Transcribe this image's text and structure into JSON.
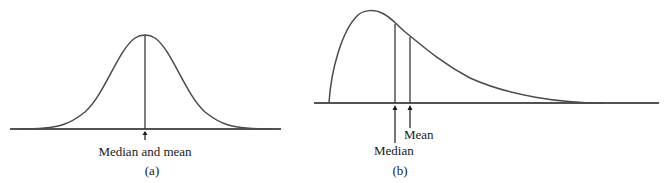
{
  "panels": [
    {
      "id": "a",
      "caption": "(a)",
      "description": "Symmetric (normal) distribution",
      "labels": {
        "center": "Median and mean"
      }
    },
    {
      "id": "b",
      "caption": "(b)",
      "description": "Right-skewed distribution",
      "labels": {
        "median": "Median",
        "mean": "Mean"
      }
    }
  ],
  "colors": {
    "curve": "#4a4a4a",
    "axis": "#1a1a1a",
    "background": "#ffffff"
  }
}
